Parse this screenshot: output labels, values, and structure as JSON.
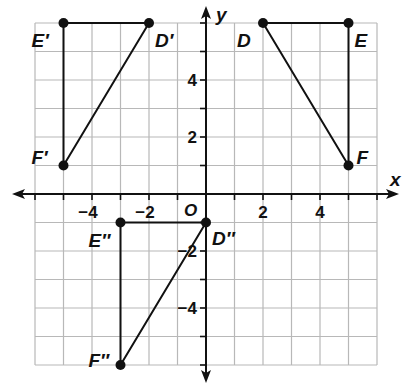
{
  "diagram": {
    "axes": {
      "x_label": "x",
      "y_label": "y",
      "origin_label": "O",
      "x_range": [
        -6,
        6
      ],
      "y_range": [
        -6,
        6
      ],
      "x_tick_labels": [
        {
          "value": -4,
          "text": "−4"
        },
        {
          "value": -2,
          "text": "−2"
        },
        {
          "value": 2,
          "text": "2"
        },
        {
          "value": 4,
          "text": "4"
        }
      ],
      "y_tick_labels": [
        {
          "value": 4,
          "text": "4"
        },
        {
          "value": 2,
          "text": "2"
        },
        {
          "value": -2,
          "text": "−2"
        },
        {
          "value": -4,
          "text": "−4"
        }
      ],
      "grid": true
    },
    "triangles": [
      {
        "name": "DEF",
        "vertices": [
          {
            "label": "D",
            "x": 2,
            "y": 6
          },
          {
            "label": "E",
            "x": 5,
            "y": 6
          },
          {
            "label": "F",
            "x": 5,
            "y": 1
          }
        ]
      },
      {
        "name": "D'E'F'",
        "vertices": [
          {
            "label": "D′",
            "x": -2,
            "y": 6
          },
          {
            "label": "E′",
            "x": -5,
            "y": 6
          },
          {
            "label": "F′",
            "x": -5,
            "y": 1
          }
        ]
      },
      {
        "name": "D''E''F''",
        "vertices": [
          {
            "label": "D″",
            "x": 0,
            "y": -1
          },
          {
            "label": "E″",
            "x": -3,
            "y": -1
          },
          {
            "label": "F″",
            "x": -3,
            "y": -6
          }
        ]
      }
    ],
    "colors": {
      "grid": "#b8b8b8",
      "axis": "#111111",
      "shape": "#111111"
    }
  }
}
